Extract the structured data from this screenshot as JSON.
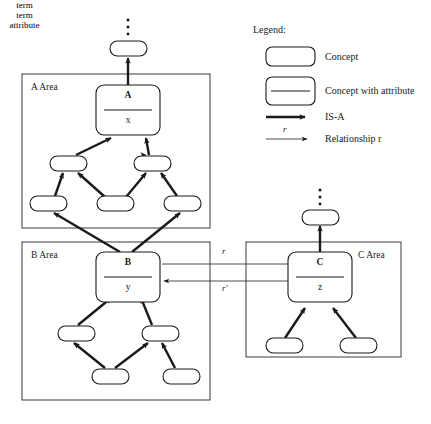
{
  "diagram": {
    "background_color": "#ffffff",
    "line_color": "#1a1a1a",
    "areas": [
      {
        "id": "a-area",
        "label": "A Area",
        "x": 22,
        "y": 74,
        "w": 188,
        "h": 154
      },
      {
        "id": "b-area",
        "label": "B Area",
        "x": 22,
        "y": 242,
        "w": 188,
        "h": 158
      },
      {
        "id": "c-area",
        "label": "C Area",
        "x": 246,
        "y": 242,
        "w": 155,
        "h": 115
      }
    ],
    "concept_nodes": [
      {
        "id": "node-a",
        "term": "A",
        "attribute": "x",
        "area": "A Area"
      },
      {
        "id": "node-b",
        "term": "B",
        "attribute": "y",
        "area": "B Area"
      },
      {
        "id": "node-c",
        "term": "C",
        "attribute": "z",
        "area": "C Area"
      }
    ],
    "ellipsis_glyph": "⋮",
    "ellipsis_dots": 3,
    "relationships": [
      {
        "id": "rel-r",
        "label": "r",
        "from": "B",
        "to": "C"
      },
      {
        "id": "rel-r-prime",
        "label": "r'",
        "from": "C",
        "to": "B"
      }
    ]
  },
  "legend": {
    "title": "Legend:",
    "entries": [
      {
        "id": "legend-concept",
        "sample_type": "concept-box",
        "sample_term": "term",
        "description": "Concept"
      },
      {
        "id": "legend-concept-attribute",
        "sample_type": "concept-attribute-box",
        "sample_term": "term",
        "sample_attribute": "attribute",
        "description": "Concept with attribute"
      },
      {
        "id": "legend-isa",
        "sample_type": "thick-arrow",
        "description": "IS-A"
      },
      {
        "id": "legend-relationship",
        "sample_type": "thin-arrow",
        "sample_label": "r",
        "description": "Relationship r"
      }
    ]
  }
}
